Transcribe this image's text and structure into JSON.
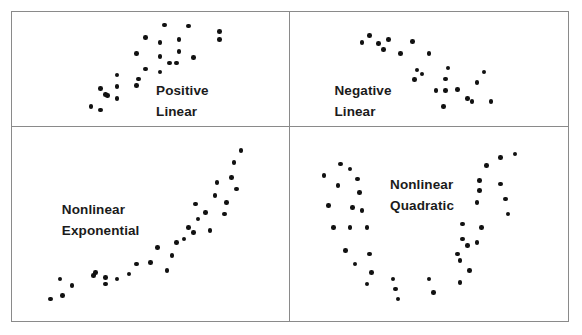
{
  "figure": {
    "title": "",
    "background_color": "#ffffff",
    "border_color": "#8a8a8a",
    "dot_color": "#111111",
    "label_color": "#1b1b1b"
  },
  "panels": [
    {
      "id": "positive-linear",
      "label_line1": "Positive",
      "label_line2": "Linear"
    },
    {
      "id": "negative-linear",
      "label_line1": "Negative",
      "label_line2": "Linear"
    },
    {
      "id": "nonlinear-exponential",
      "label_line1": "Nonlinear",
      "label_line2": "Exponential"
    },
    {
      "id": "nonlinear-quadratic",
      "label_line1": "Nonlinear",
      "label_line2": "Quadratic"
    }
  ],
  "chart_data": [
    {
      "type": "scatter",
      "title": "Positive Linear",
      "xlabel": "",
      "ylabel": "",
      "xlim": [
        0,
        100
      ],
      "ylim": [
        0,
        100
      ],
      "grid": false,
      "legend": "none",
      "annotations": [
        "Positive",
        "Linear"
      ],
      "points": [
        [
          25,
          12
        ],
        [
          29,
          8
        ],
        [
          32,
          23
        ],
        [
          36,
          20
        ],
        [
          44,
          66
        ],
        [
          48,
          82
        ],
        [
          54,
          77
        ],
        [
          54,
          63
        ],
        [
          56,
          95
        ],
        [
          66,
          94
        ],
        [
          62,
          80
        ],
        [
          62,
          68
        ],
        [
          79,
          88
        ],
        [
          79,
          80
        ],
        [
          68,
          62
        ],
        [
          48,
          50
        ],
        [
          54,
          47
        ],
        [
          58,
          56
        ],
        [
          61,
          56
        ],
        [
          36,
          44
        ],
        [
          45,
          40
        ],
        [
          29,
          30
        ],
        [
          36,
          32
        ],
        [
          44,
          33
        ],
        [
          31,
          24
        ]
      ]
    },
    {
      "type": "scatter",
      "title": "Negative Linear",
      "xlabel": "",
      "ylabel": "",
      "xlim": [
        0,
        100
      ],
      "ylim": [
        0,
        100
      ],
      "grid": false,
      "legend": "none",
      "annotations": [
        "Negative",
        "Linear"
      ],
      "points": [
        [
          25,
          84
        ],
        [
          33,
          80
        ],
        [
          29,
          76
        ],
        [
          31,
          70
        ],
        [
          22,
          77
        ],
        [
          43,
          78
        ],
        [
          38,
          66
        ],
        [
          50,
          66
        ],
        [
          45,
          49
        ],
        [
          47,
          45
        ],
        [
          44,
          39
        ],
        [
          58,
          51
        ],
        [
          57,
          40
        ],
        [
          73,
          47
        ],
        [
          70,
          36
        ],
        [
          53,
          28
        ],
        [
          57,
          28
        ],
        [
          62,
          29
        ],
        [
          66,
          20
        ],
        [
          68,
          17
        ],
        [
          76,
          17
        ],
        [
          56,
          12
        ]
      ]
    },
    {
      "type": "scatter",
      "title": "Nonlinear Exponential",
      "xlabel": "",
      "ylabel": "",
      "xlim": [
        0,
        100
      ],
      "ylim": [
        0,
        100
      ],
      "grid": false,
      "legend": "none",
      "annotations": [
        "Nonlinear",
        "Exponential"
      ],
      "points": [
        [
          8,
          5
        ],
        [
          13,
          7
        ],
        [
          17,
          13
        ],
        [
          12,
          17
        ],
        [
          26,
          19
        ],
        [
          27,
          21
        ],
        [
          31,
          18
        ],
        [
          36,
          17
        ],
        [
          41,
          20
        ],
        [
          31,
          14
        ],
        [
          44,
          26
        ],
        [
          50,
          27
        ],
        [
          53,
          36
        ],
        [
          57,
          22
        ],
        [
          59,
          31
        ],
        [
          61,
          39
        ],
        [
          64,
          41
        ],
        [
          66,
          48
        ],
        [
          68,
          45
        ],
        [
          70,
          53
        ],
        [
          69,
          62
        ],
        [
          73,
          57
        ],
        [
          75,
          46
        ],
        [
          77,
          67
        ],
        [
          78,
          75
        ],
        [
          81,
          56
        ],
        [
          82,
          63
        ],
        [
          84,
          78
        ],
        [
          85,
          87
        ],
        [
          86,
          71
        ],
        [
          88,
          94
        ]
      ]
    },
    {
      "type": "scatter",
      "title": "Nonlinear Quadratic",
      "xlabel": "",
      "ylabel": "",
      "xlim": [
        0,
        100
      ],
      "ylim": [
        0,
        100
      ],
      "grid": false,
      "legend": "none",
      "annotations": [
        "Nonlinear",
        "Quadratic"
      ],
      "points": [
        [
          6,
          79
        ],
        [
          13,
          86
        ],
        [
          17,
          83
        ],
        [
          12,
          73
        ],
        [
          20,
          77
        ],
        [
          21,
          69
        ],
        [
          8,
          61
        ],
        [
          18,
          60
        ],
        [
          22,
          58
        ],
        [
          10,
          48
        ],
        [
          17,
          48
        ],
        [
          24,
          48
        ],
        [
          15,
          34
        ],
        [
          25,
          32
        ],
        [
          19,
          26
        ],
        [
          26,
          21
        ],
        [
          24,
          14
        ],
        [
          35,
          17
        ],
        [
          36,
          11
        ],
        [
          37,
          5
        ],
        [
          50,
          17
        ],
        [
          52,
          9
        ],
        [
          63,
          15
        ],
        [
          67,
          22
        ],
        [
          62,
          32
        ],
        [
          63,
          28
        ],
        [
          64,
          41
        ],
        [
          66,
          37
        ],
        [
          70,
          39
        ],
        [
          64,
          50
        ],
        [
          72,
          48
        ],
        [
          70,
          63
        ],
        [
          71,
          70
        ],
        [
          71,
          76
        ],
        [
          74,
          85
        ],
        [
          80,
          90
        ],
        [
          80,
          74
        ],
        [
          82,
          65
        ],
        [
          83,
          56
        ],
        [
          86,
          92
        ]
      ]
    }
  ]
}
